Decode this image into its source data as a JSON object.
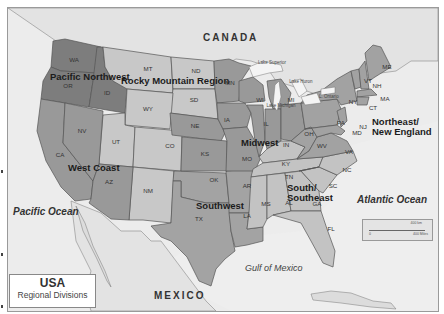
{
  "map": {
    "title": "USA",
    "subtitle": "Regional Divisions",
    "colors": {
      "land_background": "#e8e8e8",
      "pacific_northwest": "#7f7f7f",
      "rocky_mountain": "#c9c9c9",
      "west_coast": "#9a9a9a",
      "southwest": "#a3a3a3",
      "midwest": "#999999",
      "south_southeast": "#c3c3c3",
      "northeast": "#a2a2a2",
      "water": "#f4f4f4",
      "foreign_land": "#e6e6e6"
    },
    "countries": {
      "canada": "CANADA",
      "mexico": "MEXICO"
    },
    "water_bodies": {
      "pacific": "Pacific Ocean",
      "atlantic": "Atlantic Ocean",
      "gulf": "Gulf of Mexico",
      "lake_superior": "Lake Superior",
      "lake_huron": "Lake Huron",
      "lake_michigan": "Lake Michigan",
      "lake_ontario": "L. Ontario"
    },
    "regions": [
      {
        "name": "Pacific Northwest",
        "states": [
          "WA",
          "OR",
          "ID"
        ]
      },
      {
        "name": "Rocky Mountain Region",
        "states": [
          "MT",
          "WY",
          "ND",
          "SD",
          "UT",
          "CO",
          "NM"
        ]
      },
      {
        "name": "West Coast",
        "states": [
          "CA",
          "NV",
          "AZ"
        ]
      },
      {
        "name": "Southwest",
        "states": [
          "TX",
          "OK",
          "AR",
          "LA"
        ]
      },
      {
        "name": "Midwest",
        "states": [
          "MN",
          "WI",
          "MI",
          "IA",
          "IL",
          "IN",
          "OH",
          "NE",
          "KS",
          "MO"
        ]
      },
      {
        "name": "South/ Southeast",
        "states": [
          "KY",
          "TN",
          "MS",
          "AL",
          "GA",
          "FL",
          "SC",
          "NC"
        ]
      },
      {
        "name": "Northeast/ New England",
        "states": [
          "ME",
          "VT",
          "NH",
          "NY",
          "MA",
          "CT",
          "RI",
          "PA",
          "NJ",
          "MD",
          "DE",
          "WV",
          "VA"
        ]
      }
    ],
    "region_labels": {
      "pnw": "Pacific Northwest",
      "rocky": "Rocky Mountain Region",
      "west": "West Coast",
      "southwest": "Southwest",
      "midwest": "Midwest",
      "south_1": "South/",
      "south_2": "Southeast",
      "ne_1": "Northeast/",
      "ne_2": "New England"
    },
    "state_labels": {
      "WA": "WA",
      "OR": "OR",
      "ID": "ID",
      "MT": "MT",
      "ND": "ND",
      "SD": "SD",
      "WY": "WY",
      "NE": "NE",
      "NV": "NV",
      "UT": "UT",
      "CO": "CO",
      "KS": "KS",
      "CA": "CA",
      "AZ": "AZ",
      "NM": "NM",
      "OK": "OK",
      "TX": "TX",
      "MN": "MN",
      "IA": "IA",
      "MO": "MO",
      "AR": "AR",
      "LA": "LA",
      "WI": "WI",
      "IL": "IL",
      "MI": "MI",
      "IN": "IN",
      "OH": "OH",
      "KY": "KY",
      "TN": "TN",
      "MS": "MS",
      "AL": "AL",
      "GA": "GA",
      "FL": "FL",
      "SC": "SC",
      "NC": "NC",
      "WV": "WV",
      "VA": "VA",
      "PA": "PA",
      "NY": "NY",
      "MD": "MD",
      "NJ": "NJ",
      "CT": "CT",
      "MA": "MA",
      "VT": "VT",
      "NH": "NH",
      "ME": "ME"
    },
    "scale": {
      "top": "400 km",
      "bottom": "400 Miles",
      "zero": "0"
    }
  }
}
